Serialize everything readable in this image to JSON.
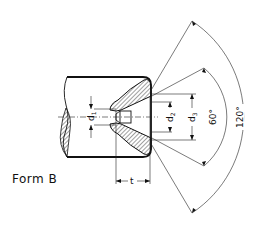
{
  "figure": {
    "form_label": "Form B",
    "dimensions": {
      "d1": "d",
      "d1_sub": "1",
      "d2": "d",
      "d2_sub": "2",
      "d3": "d",
      "d3_sub": "3",
      "t": "t"
    },
    "angles": {
      "inner": "60°",
      "outer": "120°"
    }
  }
}
